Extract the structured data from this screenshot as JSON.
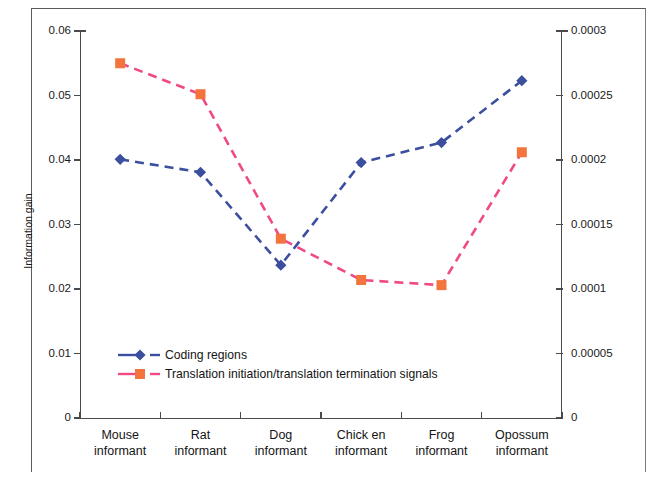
{
  "chart_data": {
    "type": "line",
    "title": "",
    "xlabel": "",
    "ylabel": "Information gain",
    "y2label": "",
    "categories": [
      "Mouse informant",
      "Rat informant",
      "Dog informant",
      "Chick en informant",
      "Frog informant",
      "Opossum informant"
    ],
    "category_lines": [
      [
        "Mouse",
        "informant"
      ],
      [
        "Rat",
        "informant"
      ],
      [
        "Dog",
        "informant"
      ],
      [
        "Chick en",
        "informant"
      ],
      [
        "Frog",
        "informant"
      ],
      [
        "Opossum",
        "informant"
      ]
    ],
    "ylim": [
      0,
      0.06
    ],
    "y2lim": [
      0,
      0.0003
    ],
    "yticks": [
      "0",
      "0.01",
      "0.02",
      "0.03",
      "0.04",
      "0.05",
      "0.06"
    ],
    "ytick_values": [
      0,
      0.01,
      0.02,
      0.03,
      0.04,
      0.05,
      0.06
    ],
    "y2ticks": [
      "0",
      "0.00005",
      "0.0001",
      "0.00015",
      "0.0002",
      "0.00025",
      "0.0003"
    ],
    "y2tick_values": [
      0,
      5e-05,
      0.0001,
      0.00015,
      0.0002,
      0.00025,
      0.0003
    ],
    "grid": false,
    "legend_position": "inside-lower-left",
    "series": [
      {
        "name": "Coding regions",
        "axis": "left",
        "color": "#3c4f9e",
        "line_color": "#3c4f9e",
        "marker": "diamond",
        "linestyle": "dashed",
        "values": [
          0.0401,
          0.0381,
          0.0237,
          0.0396,
          0.0427,
          0.0523
        ]
      },
      {
        "name": "Translation initiation/translation termination signals",
        "axis": "right",
        "color": "#f4743d",
        "line_color": "#ef4a86",
        "marker": "square",
        "linestyle": "dashed",
        "values": [
          0.000275,
          0.000251,
          0.000139,
          0.000107,
          0.000103,
          0.000206
        ]
      }
    ]
  },
  "legend": {
    "items": [
      {
        "label": "Coding regions",
        "marker": "diamond",
        "marker_color": "#3c4f9e",
        "line_color": "#3c4f9e"
      },
      {
        "label": "Translation initiation/translation termination signals",
        "marker": "square",
        "marker_color": "#f4743d",
        "line_color": "#ef4a86"
      }
    ]
  },
  "colors": {
    "coding_regions_marker": "#3c4f9e",
    "coding_regions_line": "#3c4f9e",
    "translation_marker": "#f4743d",
    "translation_line": "#ef4a86",
    "axis": "#4a4a4a",
    "frame": "#5b5b5b",
    "text": "#141414"
  }
}
